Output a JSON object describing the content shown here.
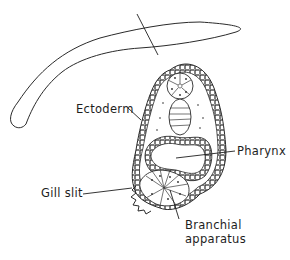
{
  "figure": {
    "type": "biological-diagram",
    "colors": {
      "ink": "#1e1e1e",
      "background": "#ffffff"
    }
  },
  "labels": {
    "ectoderm": "Ectoderm",
    "pharynx": "Pharynx",
    "gill_slit": "Gill slit",
    "branchial_line1": "Branchial",
    "branchial_line2": "apparatus"
  }
}
